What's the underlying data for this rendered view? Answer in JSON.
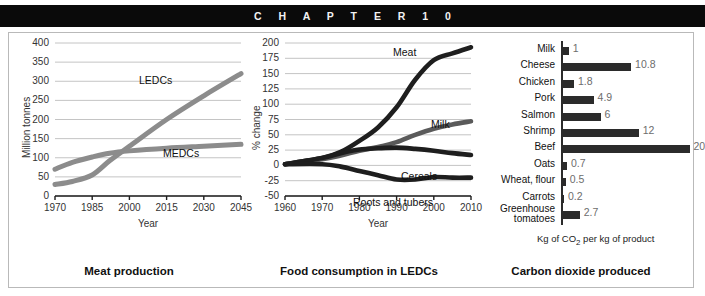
{
  "header": {
    "chapter_text": "C H A P T E R   1 0"
  },
  "charts": [
    {
      "caption": "Meat production",
      "chart_data": {
        "type": "line",
        "title": "Meat production",
        "xlabel": "Year",
        "ylabel": "Million tonnes",
        "xlim": [
          1970,
          2045
        ],
        "ylim": [
          0,
          400
        ],
        "yticks": [
          0,
          50,
          100,
          150,
          200,
          250,
          300,
          350,
          400
        ],
        "xticks": [
          1970,
          1985,
          2000,
          2015,
          2030,
          2045
        ],
        "grid": true,
        "legend": "inline-labels",
        "series": [
          {
            "name": "LEDCs",
            "color": "#8c8c8c",
            "x": [
              1970,
              1977,
              1985,
              1992,
              2000,
              2015,
              2030,
              2045
            ],
            "values": [
              30,
              38,
              55,
              92,
              130,
              200,
              262,
              320
            ]
          },
          {
            "name": "MEDCs",
            "color": "#8c8c8c",
            "x": [
              1970,
              1977,
              1985,
              1992,
              2000,
              2015,
              2030,
              2045
            ],
            "values": [
              70,
              88,
              102,
              112,
              118,
              125,
              130,
              135
            ]
          }
        ]
      }
    },
    {
      "caption": "Food consumption in LEDCs",
      "chart_data": {
        "type": "line",
        "title": "Food consumption in LEDCs",
        "xlabel": "Year",
        "ylabel": "% change",
        "xlim": [
          1960,
          2010
        ],
        "ylim": [
          -50,
          200
        ],
        "yticks": [
          -50,
          -25,
          0,
          25,
          50,
          75,
          100,
          125,
          150,
          175,
          200
        ],
        "xticks": [
          1960,
          1970,
          1980,
          1990,
          2000,
          2010
        ],
        "grid": true,
        "legend": "inline-labels",
        "series": [
          {
            "name": "Meat",
            "color": "#1e1e1e",
            "x": [
              1960,
              1970,
              1975,
              1980,
              1985,
              1990,
              1995,
              2000,
              2005,
              2010
            ],
            "values": [
              2,
              12,
              22,
              40,
              62,
              95,
              140,
              172,
              183,
              193
            ]
          },
          {
            "name": "Milk",
            "color": "#5a5a5a",
            "x": [
              1960,
              1970,
              1975,
              1980,
              1985,
              1990,
              1995,
              2000,
              2005,
              2010
            ],
            "values": [
              2,
              10,
              16,
              24,
              30,
              38,
              50,
              60,
              67,
              72
            ]
          },
          {
            "name": "Cereals",
            "color": "#1e1e1e",
            "x": [
              1960,
              1970,
              1975,
              1980,
              1985,
              1990,
              1995,
              2000,
              2005,
              2010
            ],
            "values": [
              2,
              12,
              20,
              26,
              28,
              29,
              27,
              24,
              20,
              17
            ]
          },
          {
            "name": "Roots and tubers",
            "color": "#1e1e1e",
            "x": [
              1960,
              1970,
              1975,
              1980,
              1985,
              1990,
              1995,
              2000,
              2005,
              2010
            ],
            "values": [
              2,
              2,
              -2,
              -9,
              -16,
              -23,
              -23,
              -19,
              -20,
              -20
            ]
          }
        ]
      }
    },
    {
      "caption": "Carbon dioxide produced",
      "chart_data": {
        "type": "bar",
        "orientation": "horizontal",
        "title": "Carbon dioxide produced",
        "xlabel": "Kg of CO",
        "xlabel_sub": "2",
        "xlabel_rest": " per kg of product",
        "ylabel": "",
        "xlim": [
          0,
          20
        ],
        "grid": false,
        "bar_color": "#2b2b2b",
        "label_color": "#6d6d6d",
        "categories": [
          "Milk",
          "Cheese",
          "Chicken",
          "Pork",
          "Salmon",
          "Shrimp",
          "Beef",
          "Oats",
          "Wheat, flour",
          "Carrots",
          "Greenhouse tomatoes"
        ],
        "values": [
          1,
          10.8,
          1.8,
          4.9,
          6,
          12,
          20,
          0.7,
          0.5,
          0.2,
          2.7
        ],
        "value_labels": [
          "1",
          "10.8",
          "1.8",
          "4.9",
          "6",
          "12",
          "20",
          "0.7",
          "0.5",
          "0.2",
          "2.7"
        ]
      }
    }
  ]
}
